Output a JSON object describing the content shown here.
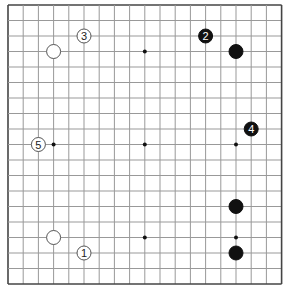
{
  "board": {
    "size": 19,
    "origin_x": 8,
    "origin_y": 5,
    "spacing_x": 15.2,
    "spacing_y": 15.5,
    "line_color": "#999999",
    "border_color": "#444444",
    "star_color": "#111111",
    "star_points": [
      [
        3,
        3
      ],
      [
        9,
        3
      ],
      [
        15,
        3
      ],
      [
        3,
        9
      ],
      [
        9,
        9
      ],
      [
        15,
        9
      ],
      [
        3,
        15
      ],
      [
        9,
        15
      ],
      [
        15,
        15
      ]
    ]
  },
  "stones": [
    {
      "col": 3,
      "row": 3,
      "color": "white",
      "label": ""
    },
    {
      "col": 15,
      "row": 3,
      "color": "black",
      "label": ""
    },
    {
      "col": 15,
      "row": 13,
      "color": "black",
      "label": ""
    },
    {
      "col": 15,
      "row": 16,
      "color": "black",
      "label": ""
    },
    {
      "col": 3,
      "row": 15,
      "color": "white",
      "label": ""
    }
  ],
  "moves": [
    {
      "col": 5,
      "row": 16,
      "color": "white",
      "label": "1"
    },
    {
      "col": 13,
      "row": 2,
      "color": "black",
      "label": "2"
    },
    {
      "col": 5,
      "row": 2,
      "color": "white",
      "label": "3"
    },
    {
      "col": 16,
      "row": 8,
      "color": "black",
      "label": "4"
    },
    {
      "col": 2,
      "row": 9,
      "color": "white",
      "label": "5"
    }
  ]
}
